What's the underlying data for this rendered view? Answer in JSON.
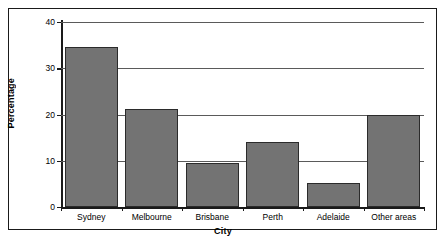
{
  "chart_data": {
    "type": "bar",
    "title": "",
    "subtitle": "",
    "xlabel": "City",
    "ylabel": "Percentage",
    "categories": [
      "Sydney",
      "Melbourne",
      "Brisbane",
      "Perth",
      "Adelaide",
      "Other areas"
    ],
    "values": [
      34.5,
      21.3,
      9.5,
      14.1,
      5.2,
      19.9
    ],
    "ylim": [
      0,
      40
    ],
    "ytick_labels": [
      "0",
      "10",
      "20",
      "30",
      "40"
    ],
    "ytick_values": [
      0,
      10,
      20,
      30,
      40
    ],
    "grid": "horizontal",
    "legend": "none",
    "series": [
      {
        "name": "Percentage",
        "values": [
          34.5,
          21.3,
          9.5,
          14.1,
          5.2,
          19.9
        ]
      }
    ],
    "colors": {
      "bar_fill": "#737373",
      "bar_edge": "#2b2b2b",
      "gridline": "#5a5a5a",
      "axis": "#1a1a1a",
      "frame": "#1a1a1a",
      "background": "#ffffff"
    }
  }
}
